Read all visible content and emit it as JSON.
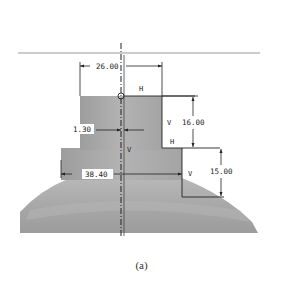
{
  "figure": {
    "caption": "(a)",
    "colors": {
      "background": "#ffffff",
      "part_fill": "#a9a9a9",
      "part_fill_light": "#c4c4c4",
      "line": "#222222",
      "datum_line": "#9a9a9a"
    }
  },
  "dimensions": {
    "top_width": "26.00",
    "upper_height": "16.00",
    "offset": "1.30",
    "lower_width": "38.40",
    "lower_height": "15.00"
  },
  "constraints": {
    "h_top": "H",
    "v_right_upper": "V",
    "h_step": "H",
    "v_center": "V",
    "v_right_lower": "V"
  }
}
